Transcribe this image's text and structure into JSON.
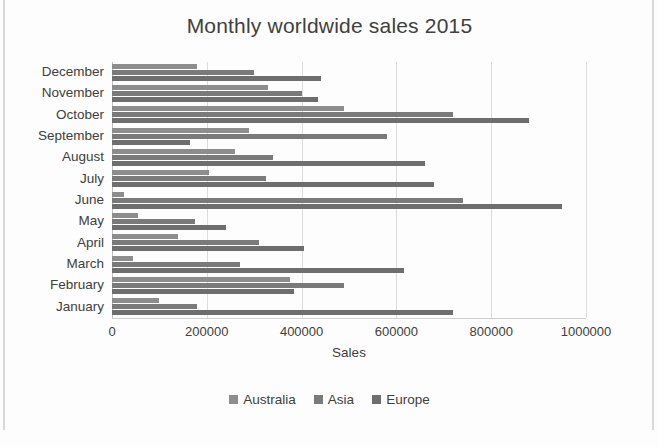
{
  "chart_data": {
    "type": "bar",
    "orientation": "horizontal",
    "title": "Monthly worldwide sales 2015",
    "xlabel": "Sales",
    "ylabel": "",
    "xlim": [
      0,
      1000000
    ],
    "xticks": [
      "0",
      "200000",
      "400000",
      "600000",
      "800000",
      "1000000"
    ],
    "xtick_values": [
      0,
      200000,
      400000,
      600000,
      800000,
      1000000
    ],
    "grid": true,
    "legend_position": "bottom",
    "categories": [
      "December",
      "November",
      "October",
      "September",
      "August",
      "July",
      "June",
      "May",
      "April",
      "March",
      "February",
      "January"
    ],
    "series": [
      {
        "name": "Australia",
        "color": "#8d8d8d",
        "values": [
          180000,
          330000,
          490000,
          290000,
          260000,
          205000,
          25000,
          55000,
          140000,
          45000,
          375000,
          100000
        ]
      },
      {
        "name": "Asia",
        "color": "#7a7a7a",
        "values": [
          300000,
          400000,
          720000,
          580000,
          340000,
          325000,
          740000,
          175000,
          310000,
          270000,
          490000,
          180000
        ]
      },
      {
        "name": "Europe",
        "color": "#6e6e6e",
        "values": [
          440000,
          435000,
          880000,
          165000,
          660000,
          680000,
          950000,
          240000,
          405000,
          615000,
          385000,
          720000
        ]
      }
    ]
  }
}
